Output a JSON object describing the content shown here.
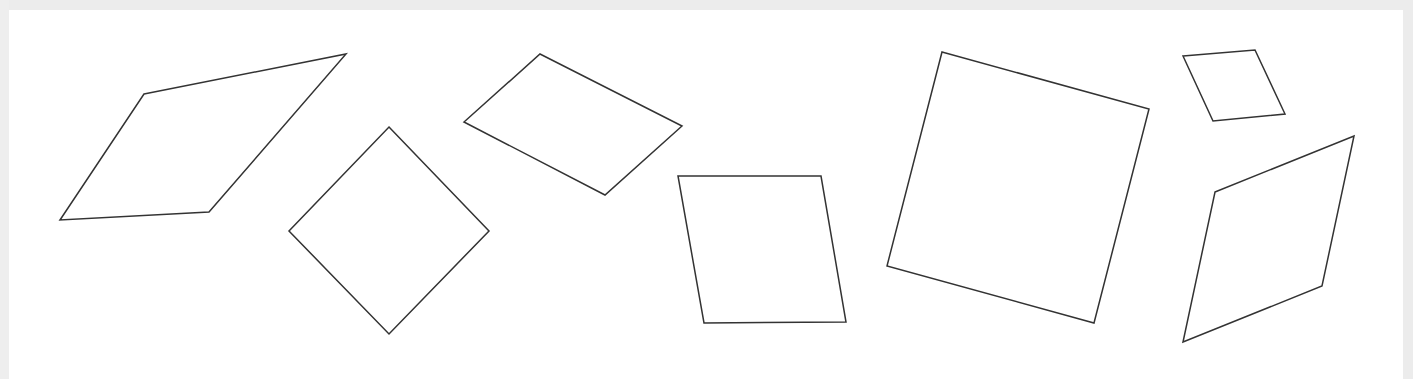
{
  "canvas": {
    "width": 1413,
    "height": 379,
    "background": "#ffffff",
    "border_color": "#ececec"
  },
  "stroke": {
    "color": "#333333",
    "width": 1.5
  },
  "shapes": [
    {
      "name": "parallelogram-1",
      "type": "parallelogram",
      "points": "144,94 346,54 209,212 60,220"
    },
    {
      "name": "square-2",
      "type": "square",
      "points": "389,127 489,231 389,334 289,231"
    },
    {
      "name": "parallelogram-3",
      "type": "parallelogram",
      "points": "540,54 682,126 605,195 464,122"
    },
    {
      "name": "parallelogram-4",
      "type": "parallelogram",
      "points": "678,176 821,176 846,322 704,323"
    },
    {
      "name": "square-5",
      "type": "square",
      "points": "942,52 1149,109 1094,323 887,266"
    },
    {
      "name": "parallelogram-6",
      "type": "parallelogram",
      "points": "1183,56 1255,50 1285,114 1213,121"
    },
    {
      "name": "parallelogram-7",
      "type": "parallelogram",
      "points": "1215,192 1354,136 1322,286 1183,342"
    }
  ]
}
